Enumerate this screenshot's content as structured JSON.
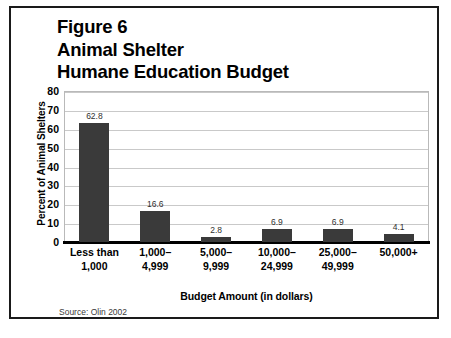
{
  "figure": {
    "title_lines": [
      "Figure 6",
      "Animal Shelter",
      "Humane Education Budget"
    ],
    "title_line_1": "Figure 6",
    "title_line_2": "Animal Shelter",
    "title_line_3": "Humane Education Budget",
    "source_note": "Source: Olin 2002",
    "border_color": "#1a1a1a",
    "background_color": "#ffffff"
  },
  "chart_data": {
    "type": "bar",
    "title": "Figure 6 Animal Shelter Humane Education Budget",
    "xlabel": "Budget Amount (in dollars)",
    "ylabel": "Percent of Animal Shelters",
    "categories": [
      "Less than\n1,000",
      "1,000–\n4,999",
      "5,000–\n9,999",
      "10,000–\n24,999",
      "25,000–\n49,999",
      "50,000+"
    ],
    "values": [
      62.8,
      16.6,
      2.8,
      6.9,
      6.9,
      4.1
    ],
    "value_labels": [
      "62.8",
      "16.6",
      "2.8",
      "6.9",
      "6.9",
      "4.1"
    ],
    "ylim": [
      0,
      80
    ],
    "ytick_values": [
      80,
      70,
      60,
      50,
      40,
      30,
      20,
      10,
      0
    ],
    "ytick_labels": [
      "80",
      "70",
      "60",
      "50",
      "40",
      "30",
      "20",
      "10",
      "0"
    ],
    "grid": true,
    "legend": false,
    "bar_color": "#3a3a3a",
    "gridline_color": "#c9c9c9",
    "axis_color": "#000000"
  }
}
